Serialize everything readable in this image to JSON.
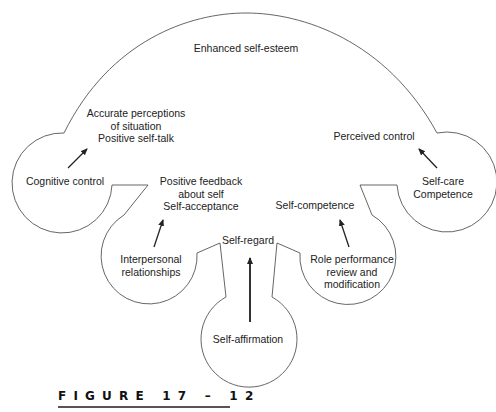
{
  "figure": {
    "caption": "FIGURE 17-12",
    "caption_display": "FIGURE  17 – 12",
    "outline_color": "#555555",
    "arrow_color": "#222222",
    "center_label": "Enhanced self-esteem",
    "nodes": [
      {
        "id": "cognitive-control",
        "source": "Cognitive control",
        "outcome_lines": [
          "Accurate perceptions",
          "of situation",
          "Positive self-talk"
        ]
      },
      {
        "id": "interpersonal-relationships",
        "source_lines": [
          "Interpersonal",
          "relationships"
        ],
        "outcome_lines": [
          "Positive feedback",
          "about self",
          "Self-acceptance"
        ]
      },
      {
        "id": "self-affirmation",
        "source": "Self-affirmation",
        "outcome": "Self-regard"
      },
      {
        "id": "role-performance",
        "source_lines": [
          "Role performance",
          "review and",
          "modification"
        ],
        "outcome": "Self-competence"
      },
      {
        "id": "self-care",
        "source_lines": [
          "Self-care",
          "Competence"
        ],
        "outcome": "Perceived control"
      }
    ]
  }
}
